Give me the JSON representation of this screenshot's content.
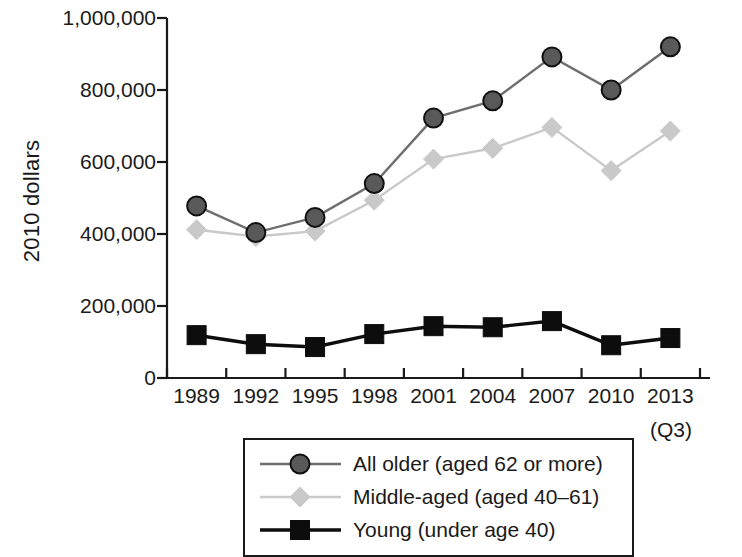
{
  "chart_data": {
    "type": "line",
    "title": "",
    "xlabel": "",
    "ylabel": "2010 dollars",
    "x_note": "(Q3)",
    "categories": [
      "1989",
      "1992",
      "1995",
      "1998",
      "2001",
      "2004",
      "2007",
      "2010",
      "2013"
    ],
    "ylim": [
      0,
      1000000
    ],
    "yticks": [
      0,
      200000,
      400000,
      600000,
      800000,
      1000000
    ],
    "ytick_labels": [
      "0",
      "200,000",
      "400,000",
      "600,000",
      "800,000",
      "1,000,000"
    ],
    "grid": false,
    "legend_position": "below-center",
    "series": [
      {
        "name": "All older (aged 62 or more)",
        "marker": "circle",
        "color": "#595959",
        "line_color": "#6e6e6e",
        "values": [
          478000,
          404000,
          446000,
          540000,
          722000,
          770000,
          892000,
          800000,
          920000
        ]
      },
      {
        "name": "Middle-aged (aged 40–61)",
        "marker": "diamond",
        "color": "#c9c9c9",
        "line_color": "#c9c9c9",
        "values": [
          412000,
          393000,
          408000,
          494000,
          608000,
          638000,
          696000,
          576000,
          686000
        ]
      },
      {
        "name": "Young (under age 40)",
        "marker": "square",
        "color": "#0d0d0d",
        "line_color": "#0d0d0d",
        "values": [
          119000,
          94000,
          86000,
          122000,
          144000,
          141000,
          158000,
          91000,
          111000
        ]
      }
    ]
  },
  "legend": {
    "items": [
      {
        "label": "All older (aged 62 or more)",
        "marker": "circle",
        "color": "#595959",
        "line_color": "#6e6e6e"
      },
      {
        "label": "Middle-aged (aged 40–61)",
        "marker": "diamond",
        "color": "#c9c9c9",
        "line_color": "#c9c9c9"
      },
      {
        "label": "Young (under age 40)",
        "marker": "square",
        "color": "#0d0d0d",
        "line_color": "#0d0d0d"
      }
    ]
  },
  "axis": {
    "line_color": "#1a1a1a"
  }
}
